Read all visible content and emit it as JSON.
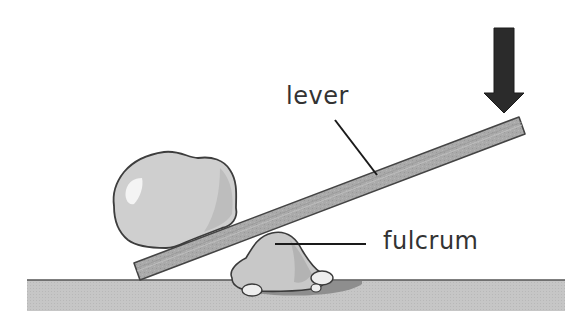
{
  "diagram": {
    "type": "lever illustration",
    "labels": {
      "lever": "lever",
      "fulcrum": "fulcrum"
    },
    "elements": {
      "ground": {
        "description": "flat ground surface",
        "color": "#c9c9c9",
        "edge_color": "#555555"
      },
      "lever": {
        "description": "long wooden plank tilted upward to the right",
        "color": "#a9a9a9",
        "edge_color": "#444444"
      },
      "load": {
        "description": "large boulder resting on the low end of the lever",
        "color": "#cfcfcf",
        "highlight": "#f2f2f2"
      },
      "fulcrum": {
        "description": "small rounded rock pivot under the lever with pebbles",
        "color": "#c8c8c8",
        "shadow": "#8e8e8e"
      },
      "effort_arrow": {
        "description": "downward arrow pushing on the raised end of the lever",
        "direction": "down",
        "color": "#2b2b2b"
      }
    },
    "colors": {
      "background": "#ffffff",
      "text": "#333333",
      "leader_line": "#1a1a1a"
    }
  }
}
